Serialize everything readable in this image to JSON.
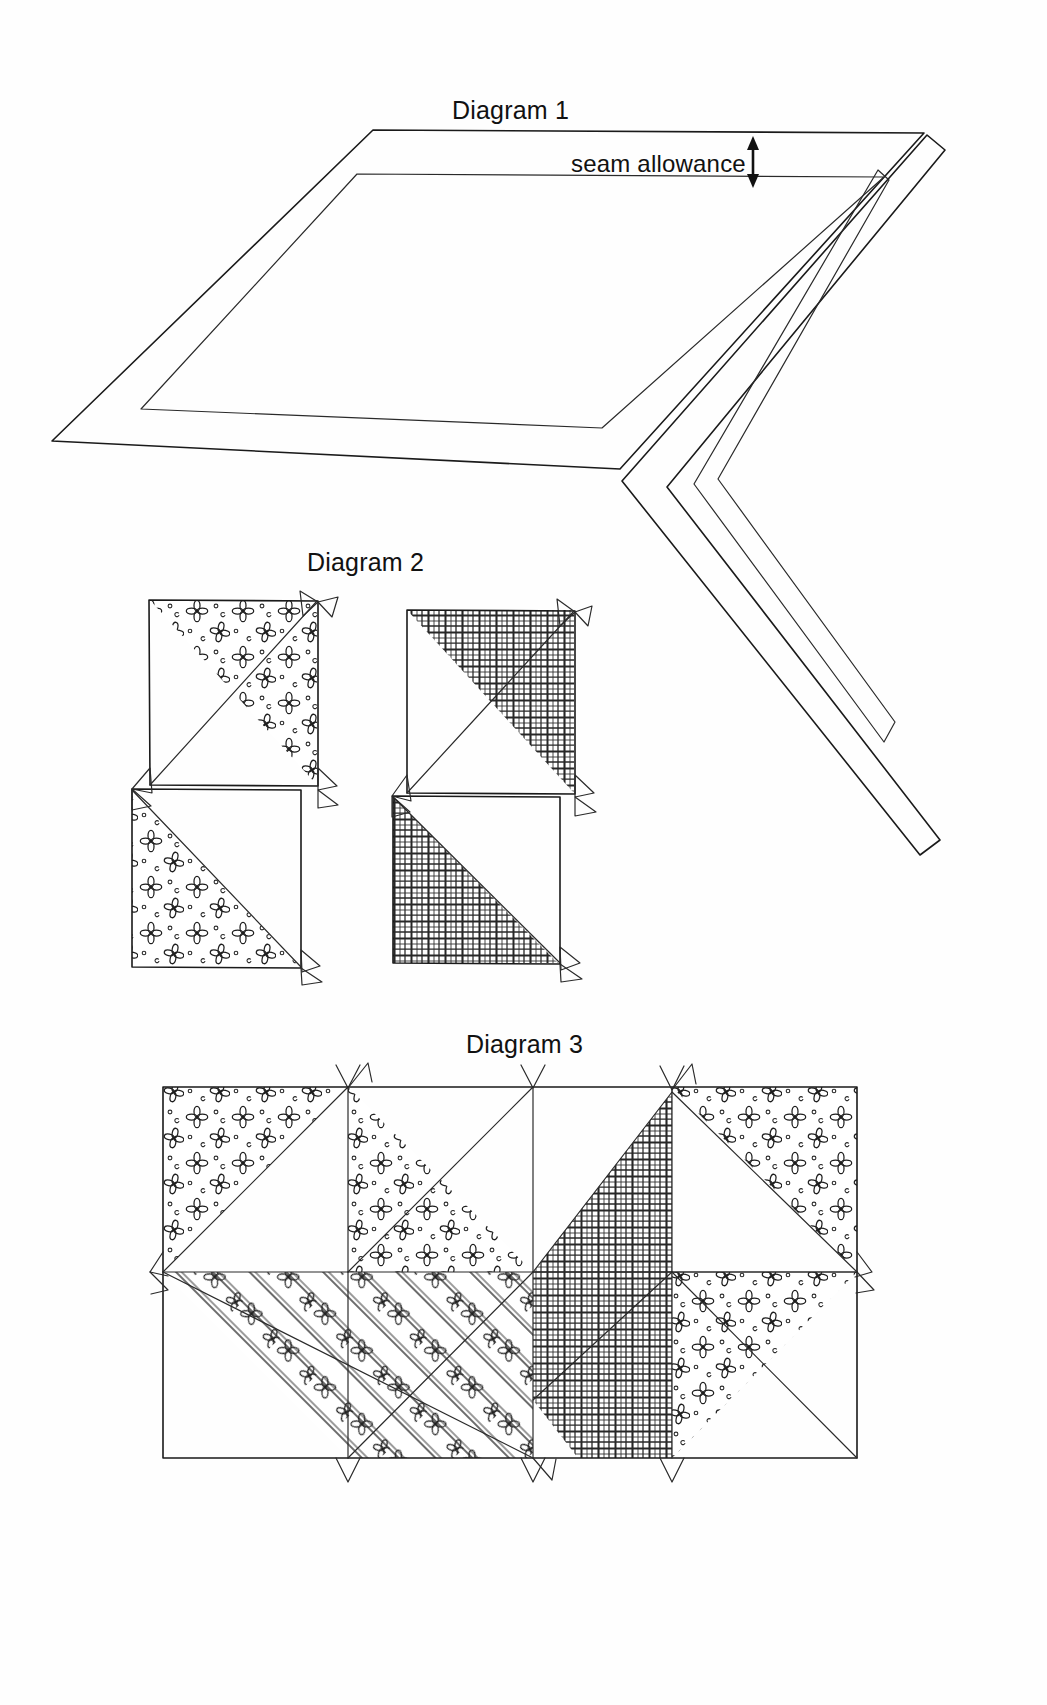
{
  "page": {
    "background_color": "#ffffff",
    "ink_color": "#1a1a1a",
    "width": 1047,
    "height": 1705
  },
  "diagrams": [
    {
      "id": "diagram-1",
      "label": "Diagram 1",
      "label_x": 452,
      "label_y": 96,
      "annotations": [
        {
          "id": "seam-allowance",
          "text": "seam allowance",
          "x": 571,
          "y": 150,
          "marker": "double-headed-vertical-arrow"
        }
      ],
      "shapes": [
        "outer-parallelogram",
        "inner-parallelogram",
        "outer-chevron",
        "inner-chevron"
      ]
    },
    {
      "id": "diagram-2",
      "label": "Diagram 2",
      "label_x": 307,
      "label_y": 548,
      "units": [
        {
          "id": "unit-left",
          "fabric_top": "floral-print",
          "fabric_bottom": "floral-print",
          "note": "two half-square triangle units, floral fabric"
        },
        {
          "id": "unit-right",
          "fabric_top": "crosshatch-plaid",
          "fabric_bottom": "crosshatch-plaid",
          "note": "two half-square triangle units, plaid fabric"
        }
      ]
    },
    {
      "id": "diagram-3",
      "label": "Diagram 3",
      "label_x": 466,
      "label_y": 1030,
      "note": "assembled chevron / flying-geese row arrangement",
      "patches": [
        {
          "position": "top-left",
          "fabric": "floral-print"
        },
        {
          "position": "top-center-left",
          "fabric": "floral-print"
        },
        {
          "position": "top-center-right",
          "fabric": "crosshatch-plaid"
        },
        {
          "position": "top-right",
          "fabric": "floral-print"
        },
        {
          "position": "bottom-left",
          "fabric": "striped-floral"
        },
        {
          "position": "bottom-center",
          "fabric": "crosshatch-plaid"
        },
        {
          "position": "bottom-right",
          "fabric": "floral-print"
        }
      ]
    }
  ],
  "fabrics": {
    "floral-print": {
      "name": "floral print",
      "motif": "four-petal flower with dots"
    },
    "crosshatch-plaid": {
      "name": "crosshatch plaid",
      "motif": "woven grid lines"
    },
    "striped-floral": {
      "name": "striped floral",
      "motif": "diagonal stripes with flowers"
    }
  }
}
